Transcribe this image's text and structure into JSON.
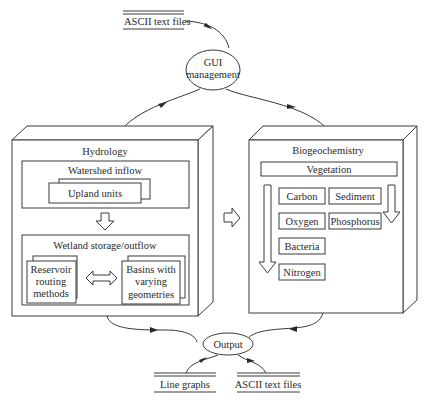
{
  "diagram": {
    "input_store": {
      "label": "ASCII text files"
    },
    "gui_node": {
      "line1": "GUI",
      "line2": "management"
    },
    "hydrology": {
      "title": "Hydrology",
      "watershed": {
        "title": "Watershed inflow",
        "upland": "Upland units"
      },
      "wetland": {
        "title": "Wetland storage/outflow",
        "reservoir": [
          "Reservoir",
          "routing",
          "methods"
        ],
        "basins": [
          "Basins with",
          "varying",
          "geometries"
        ]
      }
    },
    "biogeochemistry": {
      "title": "Biogeochemistry",
      "vegetation": "Vegetation",
      "components": {
        "carbon": "Carbon",
        "sediment": "Sediment",
        "oxygen": "Oxygen",
        "phosphorus": "Phosphorus",
        "bacteria": "Bacteria",
        "nitrogen": "Nitrogen"
      }
    },
    "output_node": {
      "label": "Output"
    },
    "output_stores": {
      "line_graphs": "Line graphs",
      "ascii_files": "ASCII text files"
    }
  }
}
